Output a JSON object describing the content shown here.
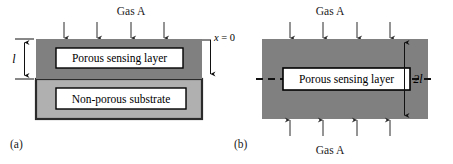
{
  "figure": {
    "background_color": "#ffffff",
    "colors": {
      "sensing_layer_fill": "#808080",
      "substrate_fill": "#b0b0b0",
      "outline": "#1a1a1a",
      "label_box_fill": "#ffffff",
      "label_box_stroke": "#000000",
      "arrow_color": "#2b2b2b",
      "text_color": "#1a1a1a"
    }
  },
  "panels": [
    {
      "id": "a",
      "caption": "(a)",
      "gas_label_top": "Gas A",
      "arrow_count_top": 4,
      "layers": [
        {
          "name": "sensing",
          "label": "Porous sensing layer",
          "fill": "#808080"
        },
        {
          "name": "substrate",
          "label": "Non-porous substrate",
          "fill": "#b0b0b0"
        }
      ],
      "dimension": {
        "label": "l",
        "position": "left",
        "style": "double-headed-arrow"
      },
      "axis": {
        "label": "x = 0",
        "variable": "x",
        "value": "0",
        "direction": "down",
        "position": "right"
      }
    },
    {
      "id": "b",
      "caption": "(b)",
      "gas_label_top": "Gas A",
      "gas_label_bottom": "Gas A",
      "arrow_count_top": 4,
      "arrow_count_bottom": 4,
      "layers": [
        {
          "name": "sensing",
          "label": "Porous sensing layer",
          "fill": "#808080"
        }
      ],
      "centerline": {
        "style": "dashed",
        "orientation": "horizontal"
      },
      "dimension": {
        "label": "2l",
        "prefix": "2",
        "variable": "l",
        "position": "right",
        "style": "double-headed-arrow"
      }
    }
  ]
}
